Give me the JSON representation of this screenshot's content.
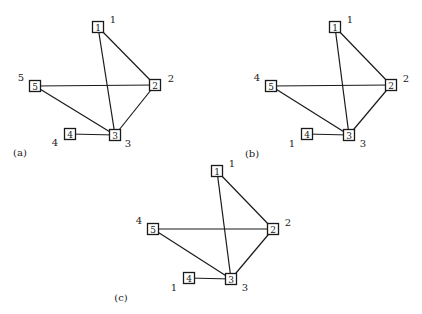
{
  "edges": [
    [
      "1",
      "2"
    ],
    [
      "1",
      "3"
    ],
    [
      "5",
      "2"
    ],
    [
      "5",
      "3"
    ],
    [
      "2",
      "3"
    ],
    [
      "4",
      "3"
    ]
  ],
  "panels": [
    {
      "id": "a",
      "caption": "(a)",
      "nodes": [
        {
          "id": "1",
          "box_label": "1",
          "outer_label": "1"
        },
        {
          "id": "2",
          "box_label": "2",
          "outer_label": "2"
        },
        {
          "id": "3",
          "box_label": "3",
          "outer_label": "3"
        },
        {
          "id": "4",
          "box_label": "4",
          "outer_label": "4"
        },
        {
          "id": "5",
          "box_label": "5",
          "outer_label": "5"
        }
      ]
    },
    {
      "id": "b",
      "caption": "(b)",
      "nodes": [
        {
          "id": "1",
          "box_label": "1",
          "outer_label": "1"
        },
        {
          "id": "2",
          "box_label": "2",
          "outer_label": "2"
        },
        {
          "id": "3",
          "box_label": "3",
          "outer_label": "3"
        },
        {
          "id": "4",
          "box_label": "4",
          "outer_label": "1"
        },
        {
          "id": "5",
          "box_label": "5",
          "outer_label": "4"
        }
      ]
    },
    {
      "id": "c",
      "caption": "(c)",
      "nodes": [
        {
          "id": "1",
          "box_label": "1",
          "outer_label": "1"
        },
        {
          "id": "2",
          "box_label": "2",
          "outer_label": "2"
        },
        {
          "id": "3",
          "box_label": "3",
          "outer_label": "3"
        },
        {
          "id": "4",
          "box_label": "4",
          "outer_label": "1"
        },
        {
          "id": "5",
          "box_label": "5",
          "outer_label": "4"
        }
      ]
    }
  ]
}
